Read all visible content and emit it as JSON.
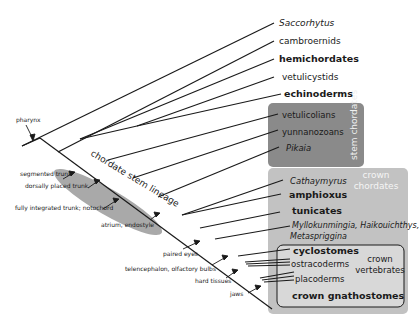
{
  "diagram": {
    "type": "cladogram",
    "colors": {
      "stem_box": "#8a8a8a",
      "crown_chordates_box": "#c2c2c2",
      "crown_vertebrates_box": "#d6d6d6",
      "stem_ellipse": "#a9a9a9",
      "line": "#1a1a1a",
      "box_label": "#f2f2f2"
    },
    "taxa": [
      {
        "name": "Saccorhytus",
        "style": "italic"
      },
      {
        "name": "cambroernids",
        "style": "normal"
      },
      {
        "name": "hemichordates",
        "style": "bold"
      },
      {
        "name": "vetulicystids",
        "style": "normal"
      },
      {
        "name": "echinoderms",
        "style": "bold"
      },
      {
        "name": "vetulicolians",
        "style": "normal"
      },
      {
        "name": "yunnanozoans",
        "style": "normal"
      },
      {
        "name": "Pikaia",
        "style": "italic"
      },
      {
        "name": "Cathaymyrus",
        "style": "italic"
      },
      {
        "name": "amphioxus",
        "style": "bold"
      },
      {
        "name": "tunicates",
        "style": "bold"
      },
      {
        "name": "Myllokunmingia, Haikouichthys,",
        "style": "italic"
      },
      {
        "name": "Metaspriggina",
        "style": "italic"
      },
      {
        "name": "cyclostomes",
        "style": "bold"
      },
      {
        "name": "ostracoderms",
        "style": "normal"
      },
      {
        "name": "placoderms",
        "style": "normal"
      },
      {
        "name": "crown gnathostomes",
        "style": "bold"
      }
    ],
    "groups": {
      "stem_chordates": "stem chordates",
      "crown_chordates_1": "crown",
      "crown_chordates_2": "chordates",
      "crown_vertebrates_1": "crown",
      "crown_vertebrates_2": "vertebrates",
      "lineage": "chordate stem lineage"
    },
    "characters": [
      "pharynx",
      "segmented trunk",
      "dorsally placed trunk",
      "fully integrated trunk; notochord",
      "atrium, endostyle",
      "paired eyes",
      "telencephalon, olfactory bulbs",
      "hard tissues",
      "jaws"
    ]
  }
}
